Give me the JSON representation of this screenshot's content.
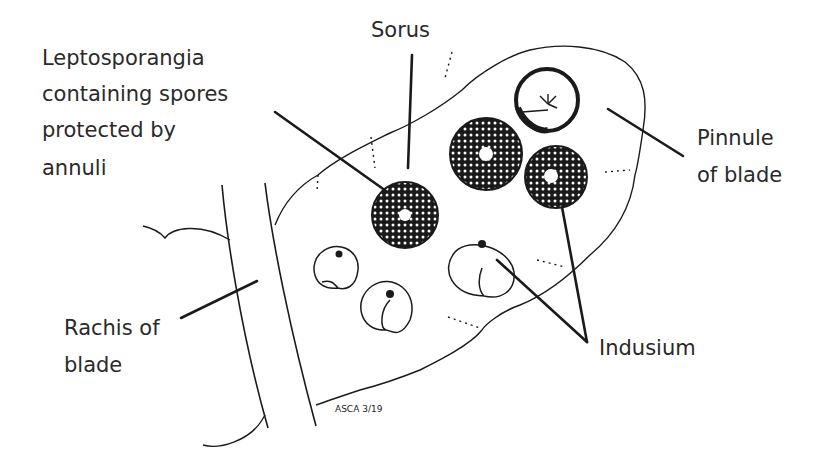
{
  "diagram": {
    "labels": {
      "sorus": "Sorus",
      "leptosporangia": [
        "Leptosporangia",
        "containing spores",
        "protected by",
        "annuli"
      ],
      "pinnule": [
        "Pinnule",
        "of blade"
      ],
      "rachis": [
        "Rachis of",
        "blade"
      ],
      "indusium": "Indusium"
    },
    "signature": "ASCA 3/19",
    "colors": {
      "ink": "#1a1a1a",
      "text": "#2a2a2a",
      "background": "#ffffff"
    }
  }
}
